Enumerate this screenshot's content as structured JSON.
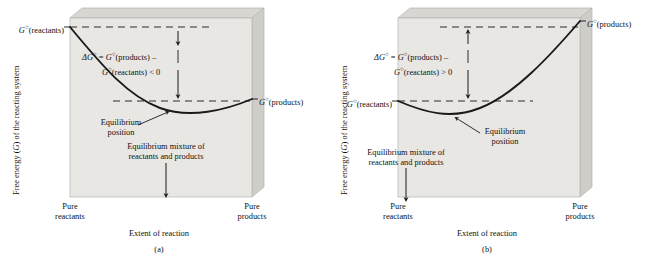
{
  "figure": {
    "y_axis_label": "Free energy (G) of the reacting system",
    "x_axis_label": "Extent of reaction"
  },
  "panels": [
    {
      "id": "a",
      "caption": "(a)",
      "sign": "< 0",
      "type": "exergonic",
      "label_reactants": "Gº(reactants)",
      "label_products": "Gº(products)",
      "delta_line1": "ΔGº = Gº(products) –",
      "delta_line2": "Gº(reactants) < 0",
      "equilibrium_line1": "Equilibrium",
      "equilibrium_line2": "position",
      "mixture_line1": "Equilibrium mixture of",
      "mixture_line2": "reactants and products",
      "x_left_line1": "Pure",
      "x_left_line2": "reactants",
      "x_right_line1": "Pure",
      "x_right_line2": "products",
      "x_axis_label": "Extent of reaction",
      "y_axis_label": "Free energy (G) of the reacting system"
    },
    {
      "id": "b",
      "caption": "(b)",
      "sign": "> 0",
      "type": "endergonic",
      "label_reactants": "Gº(reactants)",
      "label_products": "Gº(products)",
      "delta_line1": "ΔGº = Gº(products) –",
      "delta_line2": "Gº(reactants) > 0",
      "equilibrium_line1": "Equilibrium",
      "equilibrium_line2": "position",
      "mixture_line1": "Equilibrium mixture of",
      "mixture_line2": "reactants and products",
      "x_left_line1": "Pure",
      "x_left_line2": "reactants",
      "x_right_line1": "Pure",
      "x_right_line2": "products",
      "x_axis_label": "Extent of reaction",
      "y_axis_label": "Free energy (G) of the reacting system"
    }
  ],
  "colors": {
    "slab_face": "#e9e7e3",
    "slab_top": "#d8d6d2",
    "slab_side": "#cfcdc8",
    "slab_edge": "#b6b4af",
    "curve": "#1a1a1a",
    "dashed": "#2a2a2a",
    "background": "#ffffff",
    "text": "#111111"
  },
  "chart_data": {
    "type": "line",
    "xlabel": "Extent of reaction",
    "ylabel": "Free energy (G) of the reacting system",
    "xlim": [
      0,
      1
    ],
    "ylim": [
      0,
      1
    ],
    "grid": false,
    "legend": "none",
    "series": [
      {
        "name": "(a) exergonic, ΔGº < 0",
        "x": [
          0.0,
          0.1,
          0.2,
          0.3,
          0.4,
          0.5,
          0.6,
          0.7,
          0.8,
          0.9,
          1.0
        ],
        "y": [
          1.0,
          0.86,
          0.72,
          0.59,
          0.47,
          0.37,
          0.29,
          0.24,
          0.22,
          0.26,
          0.36
        ],
        "annotations": {
          "G_reactants_level": 1.0,
          "G_products_level": 0.36,
          "equilibrium_x": 0.8,
          "equilibrium_y": 0.22,
          "delta_G_sign": "negative"
        }
      },
      {
        "name": "(b) endergonic, ΔGº > 0",
        "x": [
          0.0,
          0.1,
          0.2,
          0.3,
          0.4,
          0.5,
          0.6,
          0.7,
          0.8,
          0.9,
          1.0
        ],
        "y": [
          0.36,
          0.29,
          0.25,
          0.24,
          0.28,
          0.36,
          0.47,
          0.6,
          0.74,
          0.88,
          1.0
        ],
        "annotations": {
          "G_reactants_level": 0.36,
          "G_products_level": 1.0,
          "equilibrium_x": 0.26,
          "equilibrium_y": 0.24,
          "delta_G_sign": "positive"
        }
      }
    ]
  }
}
